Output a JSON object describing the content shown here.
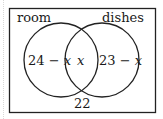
{
  "diagram": {
    "type": "venn",
    "sets": [
      {
        "label": "room",
        "only_region": "24 − x",
        "only_expr": "24 − ",
        "only_var": "x"
      },
      {
        "label": "dishes",
        "only_region": "23 − x",
        "only_expr": "23 − ",
        "only_var": "x"
      }
    ],
    "intersection": "x",
    "outside": "22"
  }
}
